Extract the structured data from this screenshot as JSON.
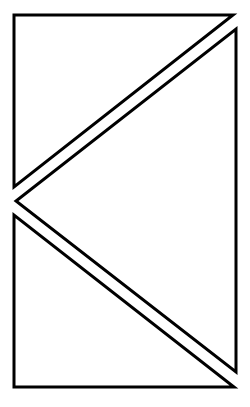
{
  "diagram": {
    "width": 250,
    "height": 407,
    "background": "#ffffff",
    "stroke_color": "#000000",
    "stroke_width": 3,
    "shapes": [
      {
        "name": "top-left-triangle",
        "type": "triangle",
        "points": "14,15 233,15 14,187"
      },
      {
        "name": "right-triangle",
        "type": "triangle",
        "points": "236,29 236,372 16,201"
      },
      {
        "name": "bottom-left-triangle",
        "type": "triangle",
        "points": "14,215 14,387 234,387"
      }
    ]
  }
}
